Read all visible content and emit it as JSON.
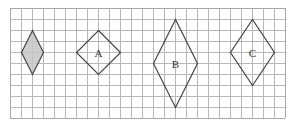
{
  "diagram": {
    "type": "grid-with-rhombuses",
    "grid": {
      "origin_x": 10,
      "origin_y": 8,
      "cell_size": 11,
      "columns": 25,
      "rows": 10,
      "line_color": "#b8b8b8",
      "border_color": "#a8a8a8"
    },
    "shapes": [
      {
        "id": "shaded",
        "label": "",
        "shaded": true,
        "fill": "#c6c6c6",
        "stroke": "#444444",
        "vertices_grid": [
          [
            2,
            2
          ],
          [
            3,
            4
          ],
          [
            2,
            6
          ],
          [
            1,
            4
          ]
        ],
        "width_cells": 2,
        "height_cells": 4
      },
      {
        "id": "A",
        "label": "A",
        "shaded": false,
        "fill": "none",
        "stroke": "#444444",
        "vertices_grid": [
          [
            8,
            2
          ],
          [
            10,
            4
          ],
          [
            8,
            6
          ],
          [
            6,
            4
          ]
        ],
        "width_cells": 4,
        "height_cells": 4
      },
      {
        "id": "B",
        "label": "B",
        "shaded": false,
        "fill": "none",
        "stroke": "#444444",
        "vertices_grid": [
          [
            15,
            1
          ],
          [
            17,
            5
          ],
          [
            15,
            9
          ],
          [
            13,
            5
          ]
        ],
        "width_cells": 4,
        "height_cells": 8
      },
      {
        "id": "C",
        "label": "C",
        "shaded": false,
        "fill": "none",
        "stroke": "#444444",
        "vertices_grid": [
          [
            22,
            1
          ],
          [
            24,
            4
          ],
          [
            22,
            7
          ],
          [
            20,
            4
          ]
        ],
        "width_cells": 4,
        "height_cells": 6
      }
    ]
  }
}
